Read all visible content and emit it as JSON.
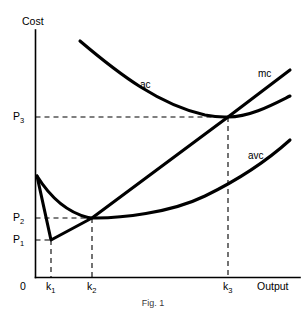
{
  "figure": {
    "caption": "Fig. 1",
    "axes": {
      "y_title": "Cost",
      "x_title": "Output",
      "origin_label": "0"
    },
    "y_ticks": [
      {
        "label": "P",
        "sub": "3",
        "value": 117
      },
      {
        "label": "P",
        "sub": "2",
        "value": 218
      },
      {
        "label": "P",
        "sub": "1",
        "value": 240
      }
    ],
    "x_ticks": [
      {
        "label": "k",
        "sub": "1",
        "value": 51
      },
      {
        "label": "k",
        "sub": "2",
        "value": 92
      },
      {
        "label": "k",
        "sub": "3",
        "value": 228
      }
    ],
    "curve_labels": {
      "ac": "ac",
      "mc": "mc",
      "avc": "avc"
    },
    "colors": {
      "curve": "#000000",
      "axis": "#000000",
      "guide": "#000000",
      "background": "#ffffff"
    }
  },
  "chart_data": {
    "type": "line",
    "title": "Fig. 1",
    "xlabel": "Output",
    "ylabel": "Cost",
    "grid": false,
    "legend": "inline-curve-labels",
    "axis_ranges": {
      "x_pixels": [
        35,
        300
      ],
      "y_pixels": [
        277,
        30
      ]
    },
    "annotations": [
      "ac attains its minimum at output k3 where mc crosses ac from below, at price level P3",
      "avc attains its minimum at output k2 where mc crosses avc from below, at price level P2",
      "mc attains its own minimum at output k1 at price level P1"
    ],
    "marked_points": [
      {
        "name": "mc-minimum",
        "x_label": "k1",
        "y_label": "P1",
        "x": 51,
        "y": 240
      },
      {
        "name": "avc-minimum-and-mc-crossing",
        "x_label": "k2",
        "y_label": "P2",
        "x": 92,
        "y": 218
      },
      {
        "name": "ac-minimum-and-mc-crossing",
        "x_label": "k3",
        "y_label": "P3",
        "x": 228,
        "y": 117
      }
    ],
    "series": [
      {
        "name": "ac",
        "label": "ac",
        "description": "U-shaped average cost curve, minimum at (k3, P3)",
        "path": "M 80 41 C 120 75, 160 105, 205 115 C 218 117.5, 222 117, 228 117 C 250 117, 272 105, 290 96"
      },
      {
        "name": "mc",
        "label": "mc",
        "description": "Marginal cost: falls steeply from the vertical intercept to its minimum at (k1, P1), then rises linearly through (k2, P2) and (k3, P3)",
        "path": "M 37 176 L 51 240 L 92 218 L 228 117 L 290 70"
      },
      {
        "name": "avc",
        "label": "avc",
        "description": "U-shaped average variable cost curve, minimum at (k2, P2)",
        "path": "M 37 176 C 52 200, 70 213, 88 217.5 C 90 218, 91 218, 92 218 C 120 218.5, 170 213, 205 196 C 240 179, 270 158, 290 140"
      }
    ]
  }
}
